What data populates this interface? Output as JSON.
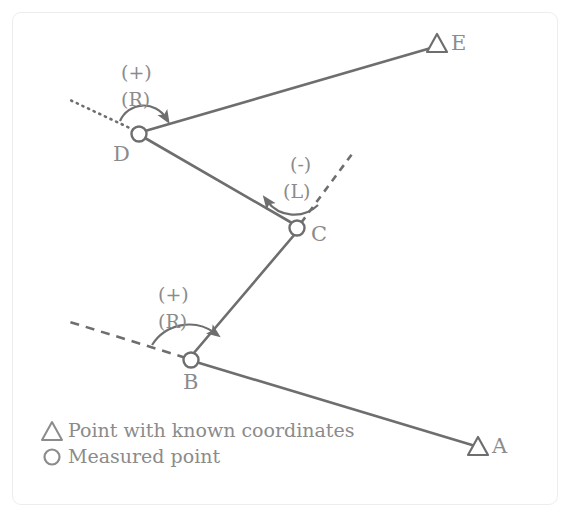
{
  "figure": {
    "type": "surveying-traverse-diagram",
    "colors": {
      "line": "#6e6e6e",
      "text": "#8b8b8b",
      "frame": "#ededed",
      "background": "#ffffff"
    },
    "points": [
      {
        "id": "A",
        "label": "A",
        "marker": "triangle",
        "kind": "known",
        "x": 478,
        "y": 448,
        "label_x": 492,
        "label_y": 440
      },
      {
        "id": "B",
        "label": "B",
        "marker": "circle",
        "kind": "measured",
        "x": 191,
        "y": 360,
        "label_x": 183,
        "label_y": 376
      },
      {
        "id": "C",
        "label": "C",
        "marker": "circle",
        "kind": "measured",
        "x": 297,
        "y": 228,
        "label_x": 311,
        "label_y": 228
      },
      {
        "id": "D",
        "label": "D",
        "marker": "circle",
        "kind": "measured",
        "x": 139,
        "y": 134,
        "label_x": 113,
        "label_y": 148
      },
      {
        "id": "E",
        "label": "E",
        "marker": "triangle",
        "kind": "known",
        "x": 437,
        "y": 45,
        "label_x": 451,
        "label_y": 37
      }
    ],
    "traverse_legs": [
      {
        "from": "A",
        "to": "B"
      },
      {
        "from": "B",
        "to": "C"
      },
      {
        "from": "C",
        "to": "D"
      },
      {
        "from": "D",
        "to": "E"
      }
    ],
    "extension_lines": [
      {
        "at": "B",
        "style": "dashed",
        "to_x": 70,
        "to_y": 322
      },
      {
        "at": "C",
        "style": "dashed",
        "to_x": 355,
        "to_y": 150
      },
      {
        "at": "D",
        "style": "dotted",
        "to_x": 70,
        "to_y": 100
      }
    ],
    "angle_annotations": [
      {
        "at": "B",
        "sign_label": "(+)",
        "direction_label": "(R)",
        "rotation": "clockwise",
        "sign_x": 158,
        "sign_y": 285,
        "dir_x": 158,
        "dir_y": 312
      },
      {
        "at": "C",
        "sign_label": "(-)",
        "direction_label": "(L)",
        "rotation": "counterclockwise",
        "sign_x": 287,
        "sign_y": 155,
        "dir_x": 283,
        "dir_y": 182
      },
      {
        "at": "D",
        "sign_label": "(+)",
        "direction_label": "(R)",
        "rotation": "clockwise",
        "sign_x": 121,
        "sign_y": 63,
        "dir_x": 121,
        "dir_y": 90
      }
    ]
  },
  "legend": {
    "items": [
      {
        "marker": "triangle",
        "marker_name": "triangle-marker",
        "label": "Point with known coordinates",
        "marker_x": 52,
        "marker_y": 431,
        "text_x": 68,
        "text_y": 423
      },
      {
        "marker": "circle",
        "marker_name": "circle-marker",
        "label": "Measured point",
        "marker_x": 52,
        "marker_y": 457,
        "text_x": 68,
        "text_y": 449
      }
    ]
  }
}
